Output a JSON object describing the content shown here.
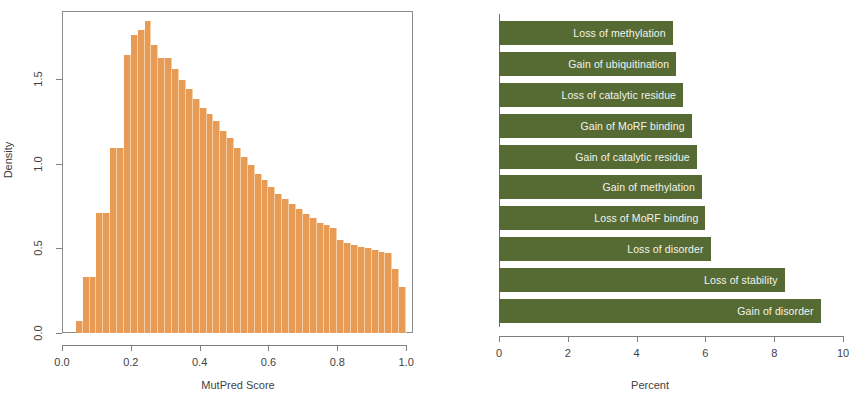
{
  "figure": {
    "panels": [
      "histogram",
      "horizontal-bar"
    ]
  },
  "chart_data": [
    {
      "type": "bar",
      "subtype": "histogram",
      "title": "",
      "xlabel": "MutPred Score",
      "ylabel": "Density",
      "xlim": [
        0.0,
        1.02
      ],
      "ylim": [
        0.0,
        1.9
      ],
      "xticks": [
        "0.0",
        "0.2",
        "0.4",
        "0.6",
        "0.8",
        "1.0"
      ],
      "xtick_values": [
        0.0,
        0.2,
        0.4,
        0.6,
        0.8,
        1.0
      ],
      "yticks": [
        "0.0",
        "0.5",
        "1.0",
        "1.5"
      ],
      "ytick_values": [
        0.0,
        0.5,
        1.0,
        1.5
      ],
      "grid": false,
      "legend": null,
      "bar_color": "#e89b55",
      "bin_width": 0.02,
      "bin_starts": [
        0.04,
        0.06,
        0.08,
        0.1,
        0.12,
        0.14,
        0.16,
        0.18,
        0.2,
        0.22,
        0.24,
        0.26,
        0.28,
        0.3,
        0.32,
        0.34,
        0.36,
        0.38,
        0.4,
        0.42,
        0.44,
        0.46,
        0.48,
        0.5,
        0.52,
        0.54,
        0.56,
        0.58,
        0.6,
        0.62,
        0.64,
        0.66,
        0.68,
        0.7,
        0.72,
        0.74,
        0.76,
        0.78,
        0.8,
        0.82,
        0.84,
        0.86,
        0.88,
        0.9,
        0.92,
        0.94,
        0.96,
        0.98
      ],
      "values": [
        0.07,
        0.33,
        0.33,
        0.71,
        0.71,
        1.09,
        1.09,
        1.64,
        1.76,
        1.79,
        1.84,
        1.7,
        1.62,
        1.62,
        1.56,
        1.49,
        1.44,
        1.38,
        1.33,
        1.29,
        1.25,
        1.19,
        1.15,
        1.09,
        1.04,
        0.99,
        0.94,
        0.9,
        0.86,
        0.82,
        0.79,
        0.76,
        0.73,
        0.7,
        0.68,
        0.65,
        0.64,
        0.62,
        0.55,
        0.53,
        0.52,
        0.51,
        0.5,
        0.49,
        0.48,
        0.47,
        0.38,
        0.27
      ]
    },
    {
      "type": "bar",
      "subtype": "horizontal-bar",
      "title": "",
      "xlabel": "Percent",
      "ylabel": "",
      "xlim": [
        0,
        10
      ],
      "xticks": [
        "0",
        "2",
        "4",
        "6",
        "8",
        "10"
      ],
      "xtick_values": [
        0,
        2,
        4,
        6,
        8,
        10
      ],
      "grid": false,
      "legend": null,
      "bar_color": "#566b33",
      "label_color": "#f2f4ee",
      "categories": [
        "Loss of methylation",
        "Gain of ubiquitination",
        "Loss of catalytic residue",
        "Gain of MoRF binding",
        "Gain of catalytic residue",
        "Gain of methylation",
        "Loss of MoRF binding",
        "Loss of disorder",
        "Loss of stability",
        "Gain of disorder"
      ],
      "values": [
        5.05,
        5.15,
        5.35,
        5.6,
        5.75,
        5.9,
        6.0,
        6.15,
        8.3,
        9.35
      ]
    }
  ]
}
